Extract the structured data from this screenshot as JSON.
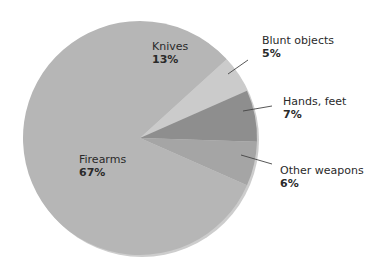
{
  "chart_data": {
    "type": "pie",
    "title": "",
    "start_angle_deg": 0,
    "direction": "clockwise",
    "slices": [
      {
        "label": "Knives",
        "value": 13,
        "display": "13%",
        "color": "#b6b6b6"
      },
      {
        "label": "Blunt objects",
        "value": 5,
        "display": "5%",
        "color": "#cbcbcb"
      },
      {
        "label": "Hands, feet",
        "value": 7,
        "display": "7%",
        "color": "#8e8e8e"
      },
      {
        "label": "Other weapons",
        "value": 6,
        "display": "6%",
        "color": "#a5a5a5"
      },
      {
        "label": "Firearms",
        "value": 67,
        "display": "67%",
        "color": "#b6b6b6"
      }
    ],
    "categories": [
      "Knives",
      "Blunt objects",
      "Hands, feet",
      "Other weapons",
      "Firearms"
    ],
    "values": [
      13,
      5,
      7,
      6,
      67
    ],
    "legend": "none (direct labels)"
  },
  "labels": {
    "knives": {
      "name": "Knives",
      "pct": "13%"
    },
    "blunt": {
      "name": "Blunt objects",
      "pct": "5%"
    },
    "hands": {
      "name": "Hands, feet",
      "pct": "7%"
    },
    "other": {
      "name": "Other weapons",
      "pct": "6%"
    },
    "firearms": {
      "name": "Firearms",
      "pct": "67%"
    }
  }
}
